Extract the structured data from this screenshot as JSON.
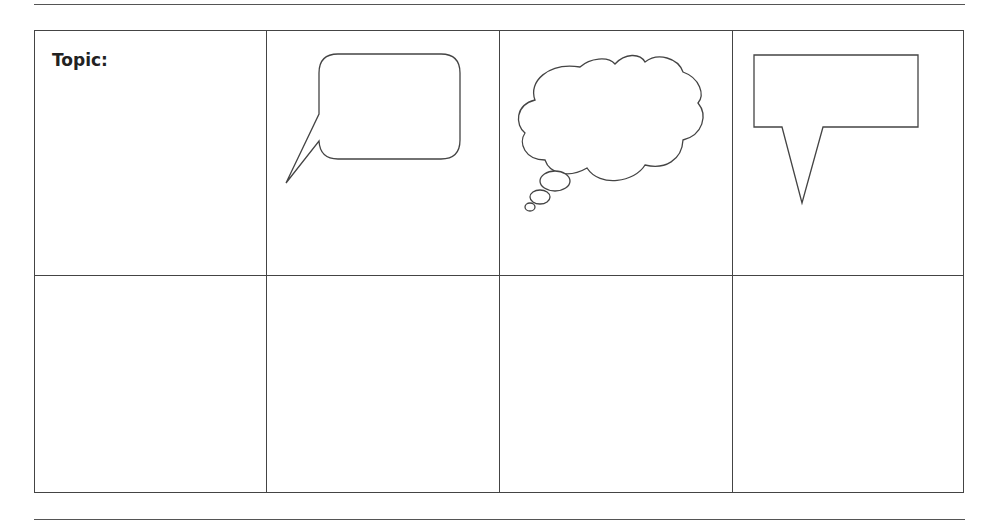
{
  "worksheet": {
    "topic_label": "Topic:",
    "grid": {
      "rows": 2,
      "columns": 4,
      "cells_row1": [
        {
          "content": "topic-label"
        },
        {
          "content": "speech-bubble-icon"
        },
        {
          "content": "thought-bubble-icon"
        },
        {
          "content": "callout-box-icon"
        }
      ],
      "cells_row2": [
        {
          "content": "empty"
        },
        {
          "content": "empty"
        },
        {
          "content": "empty"
        },
        {
          "content": "empty"
        }
      ]
    },
    "icons": [
      "speech-bubble-icon",
      "thought-bubble-icon",
      "callout-box-icon"
    ],
    "colors": {
      "line": "#444444",
      "text": "#222222",
      "background": "#ffffff"
    }
  }
}
